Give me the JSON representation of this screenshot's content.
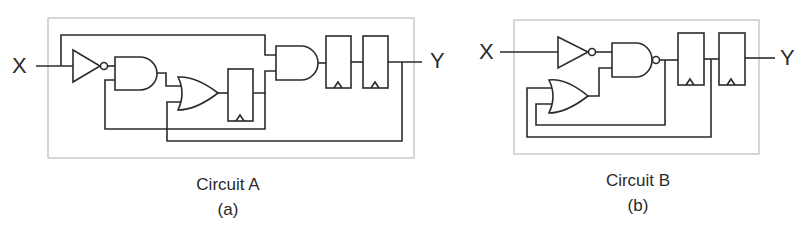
{
  "figure": {
    "panels": [
      {
        "id": "a",
        "title": "Circuit A",
        "sublabel": "(a)",
        "input_label": "X",
        "output_label": "Y",
        "components": [
          "NOT gate",
          "AND gate",
          "OR gate",
          "D flip-flop",
          "AND gate",
          "D flip-flop",
          "D flip-flop"
        ]
      },
      {
        "id": "b",
        "title": "Circuit B",
        "sublabel": "(b)",
        "input_label": "X",
        "output_label": "Y",
        "components": [
          "NOT gate",
          "NAND gate",
          "OR gate",
          "D flip-flop",
          "D flip-flop"
        ]
      }
    ],
    "colors": {
      "wire": "#2b2b2b",
      "frame": "#bdbdbd",
      "background": "#ffffff"
    }
  }
}
